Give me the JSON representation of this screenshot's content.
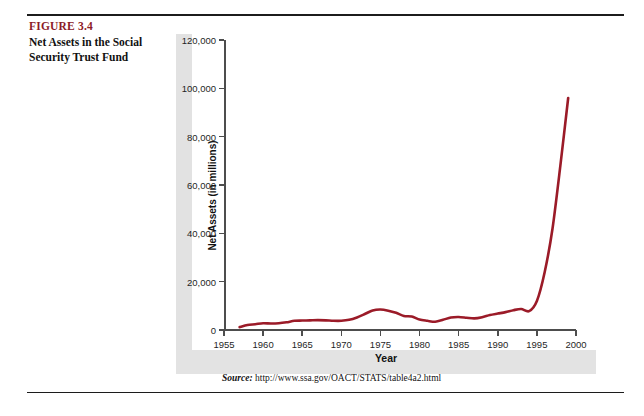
{
  "figure": {
    "number": "FIGURE 3.4",
    "title": "Net Assets in the Social Security Trust Fund",
    "accent_color": "#8c1a28"
  },
  "source": {
    "label": "Source:",
    "url": "http://www.ssa.gov/OACT/STATS/table4a2.html"
  },
  "chart_data": {
    "type": "line",
    "title": "Net Assets in the Social Security Trust Fund",
    "xlabel": "Year",
    "ylabel": "Net Assets (in millions)",
    "xlim": [
      1955,
      2000
    ],
    "ylim": [
      0,
      120000
    ],
    "grid": false,
    "legend": false,
    "line_color": "#9b1b28",
    "line_width": 2.6,
    "y_ticks": [
      0,
      20000,
      40000,
      60000,
      80000,
      100000,
      120000
    ],
    "y_tick_labels": [
      "0",
      "20,000",
      "40,000",
      "60,000",
      "80,000",
      "100,000",
      "120,000"
    ],
    "x_ticks": [
      1955,
      1960,
      1965,
      1970,
      1975,
      1980,
      1985,
      1990,
      1995,
      2000
    ],
    "x_tick_labels": [
      "1955",
      "1960",
      "1965",
      "1970",
      "1975",
      "1980",
      "1985",
      "1990",
      "1995",
      "2000"
    ],
    "x": [
      1957,
      1958,
      1959,
      1960,
      1961,
      1962,
      1963,
      1964,
      1965,
      1966,
      1967,
      1968,
      1969,
      1970,
      1971,
      1972,
      1973,
      1974,
      1975,
      1976,
      1977,
      1978,
      1979,
      1980,
      1981,
      1982,
      1983,
      1984,
      1985,
      1986,
      1987,
      1988,
      1989,
      1990,
      1991,
      1992,
      1993,
      1994,
      1995,
      1996,
      1997,
      1998,
      1999
    ],
    "values": [
      1200,
      2100,
      2400,
      2800,
      2700,
      2800,
      3200,
      3800,
      3900,
      4000,
      4100,
      4000,
      3800,
      3800,
      4200,
      5200,
      6600,
      8100,
      8500,
      8000,
      7100,
      5800,
      5600,
      4300,
      3800,
      3400,
      4200,
      5200,
      5400,
      5100,
      4800,
      5300,
      6200,
      6800,
      7400,
      8200,
      8700,
      7800,
      12000,
      24000,
      42000,
      68000,
      96000
    ],
    "annotations": []
  }
}
